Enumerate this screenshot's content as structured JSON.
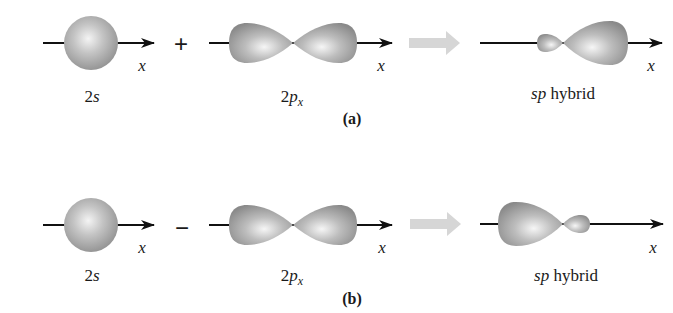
{
  "colors": {
    "orbital_fill": "#9c9c9c",
    "orbital_highlight": "#f2f2f2",
    "axis": "#111111",
    "reaction_arrow": "#d6d6d6"
  },
  "panel_a": {
    "caption": "(a)",
    "operator": "+",
    "orbital_1": {
      "label_main": "2",
      "label_italic": "s",
      "axis_label": "x"
    },
    "orbital_2": {
      "label_main": "2",
      "label_italic": "p",
      "label_sub": "x",
      "axis_label": "x"
    },
    "result": {
      "label_italic": "sp",
      "label_rest": " hybrid",
      "axis_label": "x",
      "large_lobe_direction": "right"
    }
  },
  "panel_b": {
    "caption": "(b)",
    "operator": "−",
    "orbital_1": {
      "label_main": "2",
      "label_italic": "s",
      "axis_label": "x"
    },
    "orbital_2": {
      "label_main": "2",
      "label_italic": "p",
      "label_sub": "x",
      "axis_label": "x"
    },
    "result": {
      "label_italic": "sp",
      "label_rest": " hybrid",
      "axis_label": "x",
      "large_lobe_direction": "left"
    }
  }
}
